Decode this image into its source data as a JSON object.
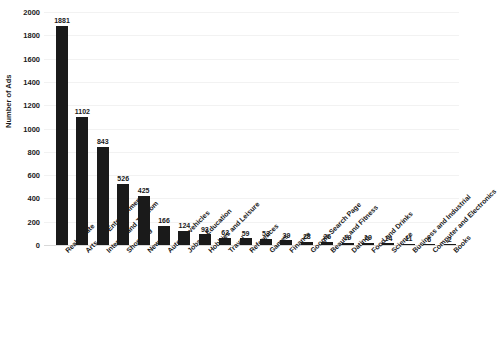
{
  "chart_data": {
    "type": "bar",
    "title": "",
    "xlabel": "",
    "ylabel": "Number of Ads",
    "ylim": [
      0,
      2000
    ],
    "yticks": [
      0,
      200,
      400,
      600,
      800,
      1000,
      1200,
      1400,
      1600,
      1800,
      2000
    ],
    "grid": true,
    "legend": null,
    "bar_color": "#1a1a1a",
    "categories": [
      "Real Estate",
      "Arts and Entertainment",
      "Internet and Telecom",
      "Shopping",
      "News",
      "Autos & vehicles",
      "Jobs & Education",
      "Hobbies and Leisure",
      "Travel",
      "References",
      "Games",
      "Finance",
      "Google Search Page",
      "Beauty and Fitness",
      "Dating",
      "Food and Drinks",
      "Science",
      "Business and Industrial",
      "Computer and Electronics",
      "Books"
    ],
    "values": [
      1881,
      1102,
      843,
      526,
      425,
      166,
      124,
      93,
      62,
      59,
      53,
      39,
      28,
      26,
      19,
      19,
      14,
      11,
      6,
      2
    ]
  }
}
